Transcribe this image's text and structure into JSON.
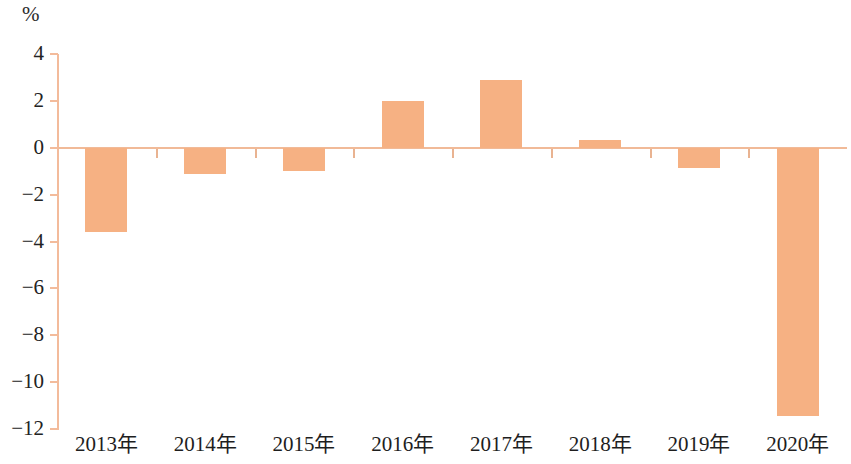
{
  "chart_data": {
    "type": "bar",
    "title": "",
    "subtitle": "",
    "xlabel": "",
    "ylabel": "%",
    "unit_label": "%",
    "categories": [
      "2013年",
      "2014年",
      "2015年",
      "2016年",
      "2017年",
      "2018年",
      "2019年",
      "2020年"
    ],
    "values": [
      -3.6,
      -1.1,
      -1.0,
      2.0,
      2.9,
      0.35,
      -0.85,
      -11.45
    ],
    "ylim": [
      -12,
      4
    ],
    "ytick_labels": [
      "4",
      "2",
      "0",
      "−2",
      "−4",
      "−6",
      "−8",
      "−10",
      "−12"
    ],
    "ytick_values": [
      4,
      2,
      0,
      -2,
      -4,
      -6,
      -8,
      -10,
      -12
    ],
    "grid": false,
    "legend": null,
    "legend_position": "none",
    "series": [
      {
        "name": "",
        "values": [
          -3.6,
          -1.1,
          -1.0,
          2.0,
          2.9,
          0.35,
          -0.85,
          -11.45
        ]
      }
    ],
    "colors": {
      "bar_fill": "#f6b183",
      "axis_line": "#f3bb9b",
      "zero_line": "#f1ba98",
      "tick_mark": "#e9b391",
      "text": "#232323",
      "background": "#ffffff"
    }
  }
}
